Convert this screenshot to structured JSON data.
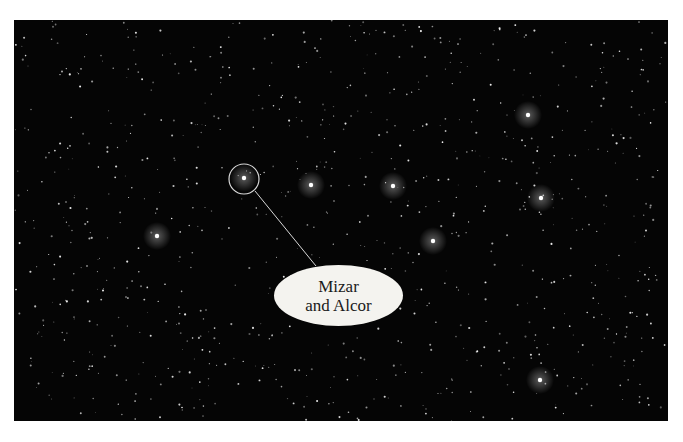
{
  "image": {
    "subject": "Star field of the Big Dipper",
    "background_color": "#050505",
    "frame_color": "#ffffff"
  },
  "callout": {
    "line1": "Mizar",
    "line2": "and Alcor",
    "target_circle": {
      "cx": 244,
      "cy": 179,
      "r": 15
    },
    "label_ellipse": {
      "cx": 339,
      "cy": 295,
      "rx": 64,
      "ry": 30
    }
  },
  "bright_stars": [
    {
      "x": 157,
      "y": 236
    },
    {
      "x": 311,
      "y": 185
    },
    {
      "x": 393,
      "y": 186
    },
    {
      "x": 433,
      "y": 241
    },
    {
      "x": 528,
      "y": 115
    },
    {
      "x": 541,
      "y": 198
    },
    {
      "x": 540,
      "y": 380
    },
    {
      "x": 244,
      "y": 178
    }
  ]
}
